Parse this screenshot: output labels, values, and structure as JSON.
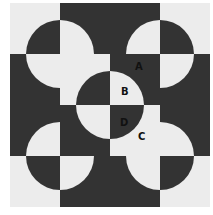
{
  "colors": {
    "dark": "#333333",
    "light": "#ececec"
  },
  "grid": {
    "rows": 4,
    "cols": 4,
    "cell_w": 50,
    "cell_h": 51,
    "radius": 34
  },
  "cells": [
    {
      "row": 0,
      "col": 0,
      "bg": "light",
      "corner": "br"
    },
    {
      "row": 0,
      "col": 1,
      "bg": "dark",
      "corner": "bl"
    },
    {
      "row": 0,
      "col": 2,
      "bg": "dark",
      "corner": "br"
    },
    {
      "row": 0,
      "col": 3,
      "bg": "light",
      "corner": "bl"
    },
    {
      "row": 1,
      "col": 0,
      "bg": "dark",
      "corner": "tr"
    },
    {
      "row": 1,
      "col": 1,
      "bg": "light",
      "corner": "br"
    },
    {
      "row": 1,
      "col": 2,
      "bg": "dark",
      "corner": "bl"
    },
    {
      "row": 1,
      "col": 3,
      "bg": "dark",
      "corner": "tl"
    },
    {
      "row": 2,
      "col": 0,
      "bg": "dark",
      "corner": "br"
    },
    {
      "row": 2,
      "col": 1,
      "bg": "dark",
      "corner": "tr"
    },
    {
      "row": 2,
      "col": 2,
      "bg": "light",
      "corner": "tl"
    },
    {
      "row": 2,
      "col": 3,
      "bg": "dark",
      "corner": "bl"
    },
    {
      "row": 3,
      "col": 0,
      "bg": "light",
      "corner": "tr"
    },
    {
      "row": 3,
      "col": 1,
      "bg": "dark",
      "corner": "tl"
    },
    {
      "row": 3,
      "col": 2,
      "bg": "dark",
      "corner": "tr"
    },
    {
      "row": 3,
      "col": 3,
      "bg": "light",
      "corner": "tl"
    }
  ],
  "labels": [
    {
      "text": "A",
      "x": 125,
      "y": 59
    },
    {
      "text": "B",
      "x": 111,
      "y": 84
    },
    {
      "text": "D",
      "x": 110,
      "y": 115
    },
    {
      "text": "C",
      "x": 128,
      "y": 129
    }
  ]
}
